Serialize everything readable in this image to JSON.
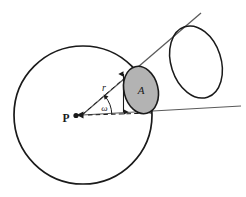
{
  "figure": {
    "background_color": "#ffffff",
    "stroke_color": "#1a1a1a",
    "ray_color": "#5a5a5a",
    "patch_fill_color": "#b3b3b3",
    "patch_stroke_color": "#1a1a1a",
    "labels": {
      "point": "P",
      "radius": "r",
      "solid_angle": "ω",
      "area": "A"
    },
    "elements": {
      "sphere": {
        "name": "large-sphere-circle",
        "center_x": 83,
        "center_y": 115,
        "radius": 69
      },
      "patch": {
        "name": "shaded-area-patch",
        "center_x": 141,
        "center_y": 90,
        "rx": 17,
        "ry": 24,
        "rotation_deg": -14
      },
      "far_cap": {
        "name": "far-ellipse-outline",
        "center_x": 196,
        "center_y": 62,
        "rx": 25,
        "ry": 37,
        "rotation_deg": -18
      },
      "ray_upper": {
        "name": "upper-cone-ray",
        "x1": 82,
        "y1": 115,
        "x2": 201,
        "y2": 13
      },
      "ray_lower": {
        "name": "lower-cone-ray",
        "x1": 82,
        "y1": 115,
        "x2": 241,
        "y2": 106
      },
      "radius_line": {
        "name": "radius-dashed-line",
        "x1": 82,
        "y1": 115,
        "x2": 134,
        "y2": 70
      },
      "axis_line": {
        "name": "axis-dashed-line",
        "x1": 82,
        "y1": 115,
        "x2": 140,
        "y2": 114
      },
      "extent_arrow": {
        "name": "patch-extent-arrow",
        "x": 123,
        "y_top": 73,
        "y_bottom": 112
      },
      "angle_arc": {
        "name": "omega-angle-arc",
        "cx": 82,
        "cy": 115,
        "radius": 29,
        "start_deg": 0,
        "end_deg": 41
      }
    },
    "label_positions": {
      "point": {
        "x": 66,
        "y": 122
      },
      "radius": {
        "x": 104,
        "y": 90
      },
      "solid_angle": {
        "x": 105,
        "y": 110
      },
      "area": {
        "x": 141,
        "y": 94
      }
    }
  }
}
